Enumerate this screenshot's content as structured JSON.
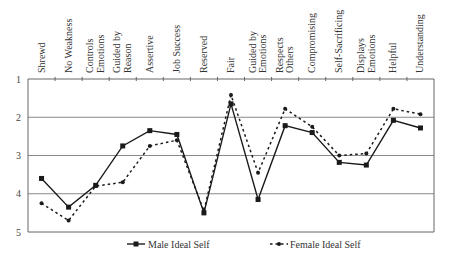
{
  "chart_data": {
    "type": "line",
    "title": "",
    "xlabel": "",
    "ylabel": "",
    "ylim": [
      1,
      5
    ],
    "y_inverted": true,
    "y_ticks": [
      "1",
      "2",
      "3",
      "4",
      "5"
    ],
    "grid": "horizontal",
    "legend_position": "bottom",
    "categories": [
      [
        "Shrewd"
      ],
      [
        "No Weakness"
      ],
      [
        "Controls",
        "Emotions"
      ],
      [
        "Guided by",
        "Reason"
      ],
      [
        "Assertive"
      ],
      [
        "Job Success"
      ],
      [
        "Reserved"
      ],
      [
        "Fair"
      ],
      [
        "Guided by",
        "Emotions"
      ],
      [
        "Respects",
        "Others"
      ],
      [
        "Compromising"
      ],
      [
        "Self-Sacrificing"
      ],
      [
        "Displays",
        "Emotions"
      ],
      [
        "Helpful"
      ],
      [
        "Understanding"
      ]
    ],
    "series": [
      {
        "name": "Male Ideal Self",
        "style": "solid",
        "marker": "square",
        "color": "#1a1a1a",
        "values": [
          3.6,
          4.35,
          3.78,
          2.75,
          2.35,
          2.45,
          4.5,
          1.65,
          4.15,
          2.22,
          2.4,
          3.18,
          3.25,
          2.08,
          2.28
        ]
      },
      {
        "name": "Female Ideal Self",
        "style": "dotted",
        "marker": "circle",
        "color": "#1a1a1a",
        "values": [
          4.25,
          4.7,
          3.8,
          3.7,
          2.75,
          2.6,
          4.45,
          1.42,
          3.45,
          1.78,
          2.25,
          3.0,
          2.95,
          1.78,
          1.92
        ]
      }
    ]
  },
  "legend": {
    "male_label": "Male Ideal Self",
    "female_label": "Female Ideal Self"
  }
}
